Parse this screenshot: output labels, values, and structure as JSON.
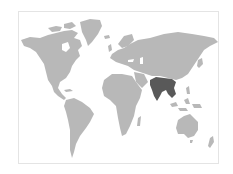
{
  "map": {
    "title": "World map",
    "highlighted_region": "South and Southeast Asia (India, Myanmar, Thailand, Laos, Cambodia, Vietnam, Bangladesh, Nepal, Bhutan)",
    "colors": {
      "background": "#ffffff",
      "frame": "#e4e4e4",
      "land": "#b8b8b8",
      "highlight": "#595959"
    }
  }
}
